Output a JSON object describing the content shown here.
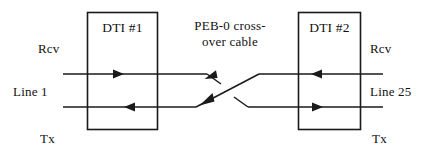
{
  "diagram": {
    "background_color": "#ffffff",
    "stroke_color": "#1a1a1a",
    "text_color": "#111111",
    "boxes": [
      {
        "id": "dti-1",
        "label": "DTI #1"
      },
      {
        "id": "dti-2",
        "label": "DTI #2"
      }
    ],
    "cable": {
      "line_1": "PEB-0 cross-",
      "line_2": "over cable"
    },
    "left_labels": {
      "rcv": "Rcv",
      "line": "Line 1",
      "tx": "Tx"
    },
    "right_labels": {
      "rcv": "Rcv",
      "line": "Line 25",
      "tx": "Tx"
    },
    "signal_paths": [
      {
        "name": "left-rcv-path",
        "from": "Line 1 Rcv",
        "to": "DTI #1",
        "direction": "right",
        "y": 74
      },
      {
        "name": "left-tx-path",
        "from": "DTI #1",
        "to": "Line 1 Tx",
        "direction": "left",
        "y": 107
      },
      {
        "name": "right-rcv-path",
        "from": "Line 25 Rcv",
        "to": "DTI #2",
        "direction": "left",
        "y": 74
      },
      {
        "name": "right-tx-path",
        "from": "DTI #2",
        "to": "Line 25 Tx",
        "direction": "right",
        "y": 107
      },
      {
        "name": "crossover-diagonal",
        "from": "DTI #2 upper",
        "to": "DTI #1 lower",
        "direction": "down-left"
      }
    ]
  }
}
